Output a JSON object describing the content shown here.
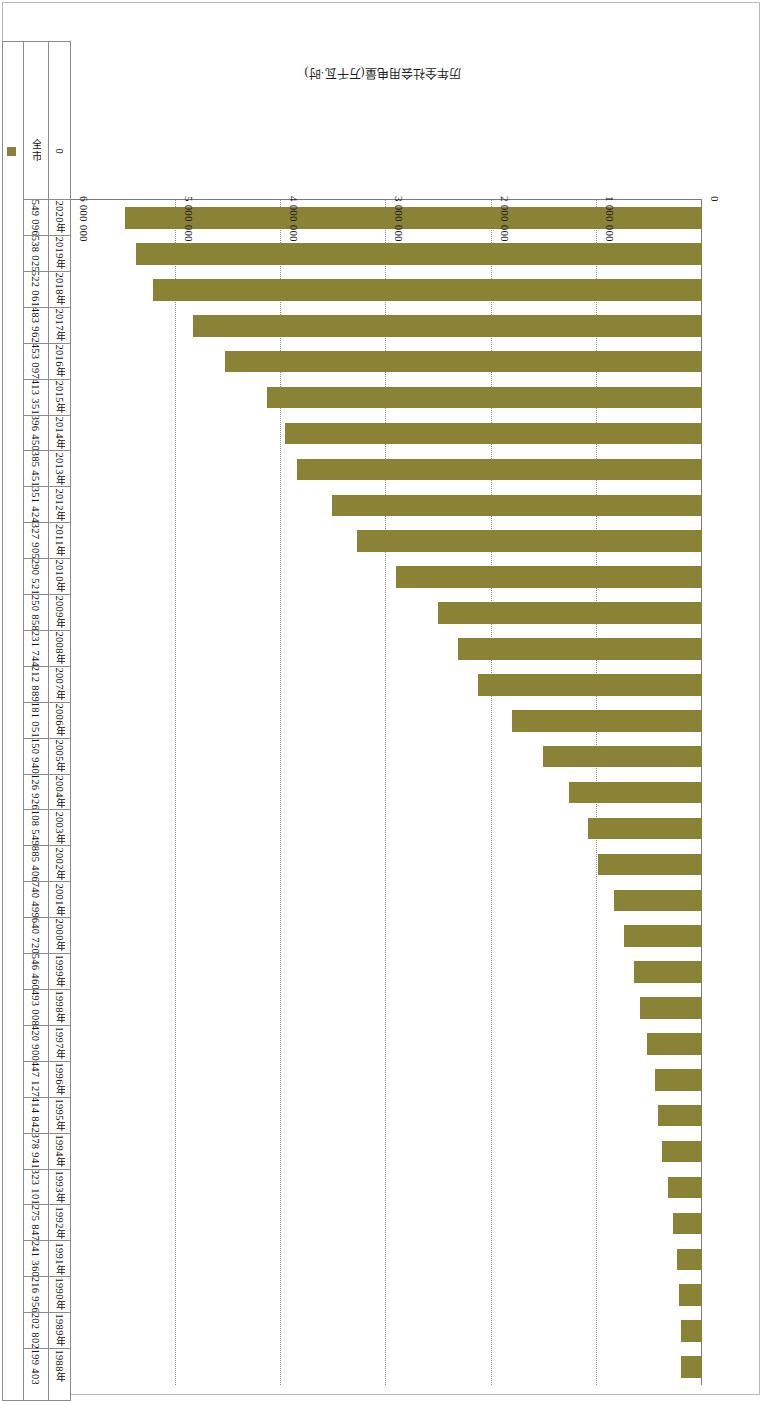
{
  "chart_data": {
    "type": "bar",
    "orientation": "horizontal",
    "title": "",
    "xlabel": "历年全社会用电量(万千瓦·时)",
    "ylabel": "",
    "legend": [
      "全市"
    ],
    "legend_position": "bottom-right",
    "grid": true,
    "axis_ticks": [
      "0",
      "1 000 000",
      "2 000 000",
      "3 000 000",
      "4 000 000",
      "5 000 000",
      "6 000 000"
    ],
    "axis_tick_values": [
      0,
      1000000,
      2000000,
      3000000,
      4000000,
      5000000,
      6000000
    ],
    "xlim": [
      0,
      6000000
    ],
    "row_header": "全市",
    "categories": [
      "1988年",
      "1989年",
      "1990年",
      "1991年",
      "1992年",
      "1993年",
      "1994年",
      "1995年",
      "1996年",
      "1997年",
      "1998年",
      "1999年",
      "2000年",
      "2001年",
      "2002年",
      "2003年",
      "2004年",
      "2005年",
      "2006年",
      "2007年",
      "2008年",
      "2009年",
      "2010年",
      "2011年",
      "2012年",
      "2013年",
      "2014年",
      "2015年",
      "2016年",
      "2017年",
      "2018年",
      "2019年",
      "2020年"
    ],
    "value_labels": [
      "199 403",
      "202 802",
      "216 956",
      "241 360",
      "275 847",
      "323 101",
      "378 941",
      "414 842",
      "447 127",
      "420 900",
      "493 008",
      "546 460",
      "640 720",
      "740 499",
      "885 406",
      "108 549",
      "126 926",
      "150 940",
      "181 051",
      "212 889",
      "231 744",
      "250 858",
      "290 521",
      "327 905",
      "351 424",
      "385 451",
      "396 450",
      "413 351",
      "453 097",
      "483 962",
      "522 061",
      "538 025",
      "549 096"
    ],
    "values": [
      199403,
      202802,
      216956,
      241360,
      275847,
      323101,
      378941,
      414842,
      447127,
      520900,
      593008,
      646460,
      740720,
      840499,
      985406,
      1085490,
      1269260,
      1509400,
      1810510,
      2128890,
      2317440,
      2508580,
      2905210,
      3279050,
      3514240,
      3854510,
      3964500,
      4133510,
      4530970,
      4839620,
      5220610,
      5380250,
      5490960
    ]
  }
}
